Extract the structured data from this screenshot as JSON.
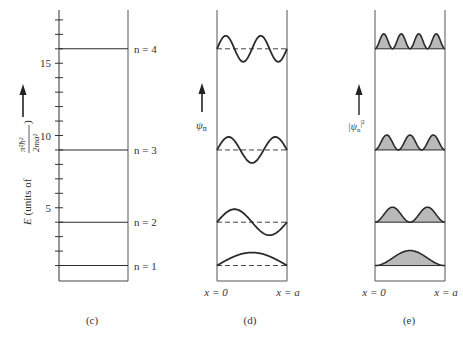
{
  "figure": {
    "panels": [
      {
        "id": "c",
        "caption": "(c)",
        "y_axis": {
          "label_prefix": "E (units of ",
          "label_fraction_num": "π²ħ²",
          "label_fraction_den": "2ma²",
          "label_suffix": ")",
          "ticks": [
            {
              "value": 5,
              "label": "5"
            },
            {
              "value": 10,
              "label": "10"
            },
            {
              "value": 15,
              "label": "15"
            }
          ],
          "range": [
            0,
            17.5
          ]
        },
        "levels": [
          {
            "n": 1,
            "energy": 1,
            "label": "n = 1"
          },
          {
            "n": 2,
            "energy": 4,
            "label": "n = 2"
          },
          {
            "n": 3,
            "energy": 9,
            "label": "n = 3"
          },
          {
            "n": 4,
            "energy": 16,
            "label": "n = 4"
          }
        ]
      },
      {
        "id": "d",
        "caption": "(d)",
        "axis_label": "ψn",
        "axis_label_base": "ψ",
        "axis_label_sub": "n",
        "x_left_label": "x = 0",
        "x_right_label": "x = a",
        "curves": "wavefunction ψn = sin(nπx/a), n = 1..4"
      },
      {
        "id": "e",
        "caption": "(e)",
        "axis_label_base": "|ψ",
        "axis_label_sub": "n",
        "axis_label_sup": "|²",
        "x_left_label": "x = 0",
        "x_right_label": "x = a",
        "curves": "probability density |ψn|², n = 1..4 (shaded)"
      }
    ],
    "colors": {
      "line": "#2b2b2b",
      "frame": "#555555",
      "fill": "#b9b9b9",
      "dash": "#444444"
    }
  }
}
